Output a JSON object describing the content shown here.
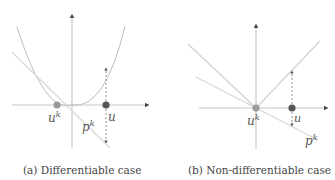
{
  "figures": [
    {
      "id": "a",
      "caption": "(a) Differentiable case",
      "labels": {
        "uk_base": "u",
        "uk_sup": "k",
        "pk_base": "p",
        "pk_sup": "k",
        "u": "u"
      }
    },
    {
      "id": "b",
      "caption": "(b) Non-differentiable case",
      "labels": {
        "uk_base": "u",
        "uk_sup": "k",
        "pk_base": "p",
        "pk_sup": "k",
        "u": "u"
      }
    }
  ],
  "colors": {
    "axis": "#c8c8c8",
    "curve": "#bdbdbd",
    "tangent": "#d9d9d9",
    "dot_uk": "#9a9a9a",
    "dot_u": "#555555",
    "dashed": "#777777",
    "text": "#444444"
  }
}
